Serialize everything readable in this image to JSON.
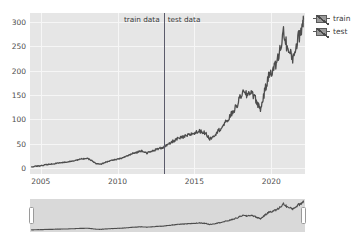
{
  "chart_data": {
    "type": "line",
    "title": "",
    "xlabel": "",
    "ylabel": "",
    "xlim": [
      2004.3,
      2022.2
    ],
    "ylim": [
      -12,
      318
    ],
    "grid": true,
    "xticks": [
      2005,
      2010,
      2015,
      2020
    ],
    "xticklabels": [
      "2005",
      "2010",
      "2015",
      "2020"
    ],
    "yticks": [
      0,
      50,
      100,
      150,
      200,
      250,
      300
    ],
    "yticklabels": [
      "0",
      "50",
      "100",
      "150",
      "200",
      "250",
      "300"
    ],
    "legend": {
      "position": "upper right outside",
      "entries": [
        "train",
        "test"
      ]
    },
    "annotations": [
      {
        "text": "train data",
        "x": 2013.0,
        "align": "right"
      },
      {
        "text": "test data",
        "x": 2013.0,
        "align": "left"
      }
    ],
    "split_x": 2013.0,
    "series": [
      {
        "name": "train",
        "color": "#4d4d4d",
        "x": [
          2004.4,
          2004.7,
          2005.0,
          2005.3,
          2005.6,
          2005.9,
          2006.2,
          2006.5,
          2006.8,
          2007.1,
          2007.4,
          2007.7,
          2008.0,
          2008.3,
          2008.6,
          2008.9,
          2009.2,
          2009.5,
          2009.8,
          2010.1,
          2010.4,
          2010.7,
          2011.0,
          2011.3,
          2011.6,
          2011.9,
          2012.2,
          2012.5,
          2012.8,
          2013.0
        ],
        "y": [
          2,
          4,
          5,
          7,
          8,
          9,
          11,
          12,
          13,
          15,
          17,
          19,
          20,
          16,
          9,
          8,
          12,
          15,
          17,
          19,
          22,
          26,
          30,
          33,
          36,
          31,
          34,
          38,
          41,
          43
        ]
      },
      {
        "name": "test",
        "color": "#4d4d4d",
        "x": [
          2013.0,
          2013.3,
          2013.6,
          2013.9,
          2014.2,
          2014.5,
          2014.8,
          2015.1,
          2015.4,
          2015.7,
          2016.0,
          2016.3,
          2016.6,
          2016.9,
          2017.2,
          2017.5,
          2017.8,
          2018.1,
          2018.4,
          2018.7,
          2019.0,
          2019.3,
          2019.6,
          2019.9,
          2020.2,
          2020.5,
          2020.8,
          2021.1,
          2021.4,
          2021.7,
          2022.0,
          2022.1
        ],
        "y": [
          43,
          48,
          55,
          60,
          63,
          66,
          70,
          73,
          76,
          72,
          60,
          68,
          78,
          88,
          100,
          115,
          130,
          155,
          150,
          158,
          140,
          120,
          160,
          195,
          205,
          230,
          280,
          240,
          225,
          260,
          290,
          305
        ]
      }
    ],
    "overview": {
      "name": "range-overview",
      "color": "#4d4d4d",
      "selection": [
        2004.4,
        2022.1
      ]
    }
  }
}
